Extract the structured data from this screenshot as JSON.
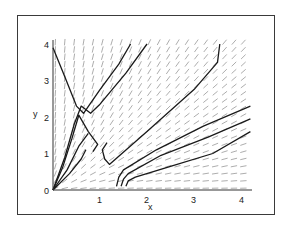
{
  "chart_data": {
    "type": "line",
    "subtype": "direction-field-phase-portrait",
    "title": "",
    "xlabel": "x",
    "ylabel": "y",
    "xlim": [
      0,
      4.2
    ],
    "ylim": [
      0,
      4.1
    ],
    "x_ticks": [
      "0",
      "1",
      "2",
      "3",
      "4"
    ],
    "y_ticks": [
      "0",
      "1",
      "2",
      "3",
      "4"
    ],
    "grid": false,
    "legend": null,
    "field_color": "#8a8a8a",
    "curve_color": "#1a1a1a",
    "series": [
      {
        "name": "trajectory-1",
        "points": [
          [
            0.0,
            3.9
          ],
          [
            0.25,
            3.1
          ],
          [
            0.5,
            2.3
          ],
          [
            0.65,
            2.1
          ],
          [
            1.0,
            2.75
          ],
          [
            1.4,
            3.45
          ],
          [
            1.65,
            4.0
          ]
        ]
      },
      {
        "name": "trajectory-2",
        "points": [
          [
            0.0,
            0.0
          ],
          [
            0.25,
            0.9
          ],
          [
            0.45,
            1.8
          ],
          [
            0.6,
            2.3
          ],
          [
            0.8,
            2.1
          ],
          [
            1.0,
            2.35
          ],
          [
            1.55,
            3.2
          ],
          [
            2.0,
            4.0
          ]
        ]
      },
      {
        "name": "trajectory-3",
        "points": [
          [
            0.0,
            0.0
          ],
          [
            0.2,
            0.6
          ],
          [
            0.4,
            1.4
          ],
          [
            0.55,
            2.05
          ],
          [
            0.75,
            1.6
          ],
          [
            0.95,
            1.25
          ],
          [
            0.85,
            1.05
          ]
        ]
      },
      {
        "name": "trajectory-4",
        "points": [
          [
            0.0,
            0.0
          ],
          [
            0.3,
            0.55
          ],
          [
            0.55,
            1.2
          ],
          [
            0.75,
            1.55
          ]
        ]
      },
      {
        "name": "trajectory-5",
        "points": [
          [
            0.0,
            0.0
          ],
          [
            0.35,
            0.45
          ],
          [
            0.6,
            0.85
          ],
          [
            0.7,
            1.1
          ]
        ]
      },
      {
        "name": "trajectory-6",
        "points": [
          [
            1.15,
            1.3
          ],
          [
            1.05,
            1.1
          ],
          [
            1.1,
            0.85
          ],
          [
            1.2,
            0.7
          ],
          [
            2.0,
            1.6
          ],
          [
            3.0,
            2.75
          ],
          [
            3.5,
            3.5
          ],
          [
            3.55,
            4.0
          ]
        ]
      },
      {
        "name": "trajectory-7",
        "points": [
          [
            1.35,
            0.1
          ],
          [
            1.4,
            0.35
          ],
          [
            1.5,
            0.55
          ],
          [
            2.2,
            1.1
          ],
          [
            3.2,
            1.75
          ],
          [
            4.2,
            2.3
          ]
        ]
      },
      {
        "name": "trajectory-8",
        "points": [
          [
            1.45,
            0.1
          ],
          [
            1.5,
            0.3
          ],
          [
            1.6,
            0.45
          ],
          [
            2.3,
            0.95
          ],
          [
            3.3,
            1.45
          ],
          [
            4.2,
            1.95
          ]
        ]
      },
      {
        "name": "trajectory-9",
        "points": [
          [
            1.55,
            0.1
          ],
          [
            1.6,
            0.25
          ],
          [
            1.75,
            0.35
          ],
          [
            2.5,
            0.65
          ],
          [
            3.4,
            1.0
          ],
          [
            4.2,
            1.6
          ]
        ]
      }
    ]
  },
  "axes": {
    "x_label": "x",
    "y_label": "y",
    "x_tick_labels": [
      "0",
      "1",
      "2",
      "3",
      "4"
    ],
    "y_tick_labels": [
      "0",
      "1",
      "2",
      "3",
      "4"
    ]
  }
}
